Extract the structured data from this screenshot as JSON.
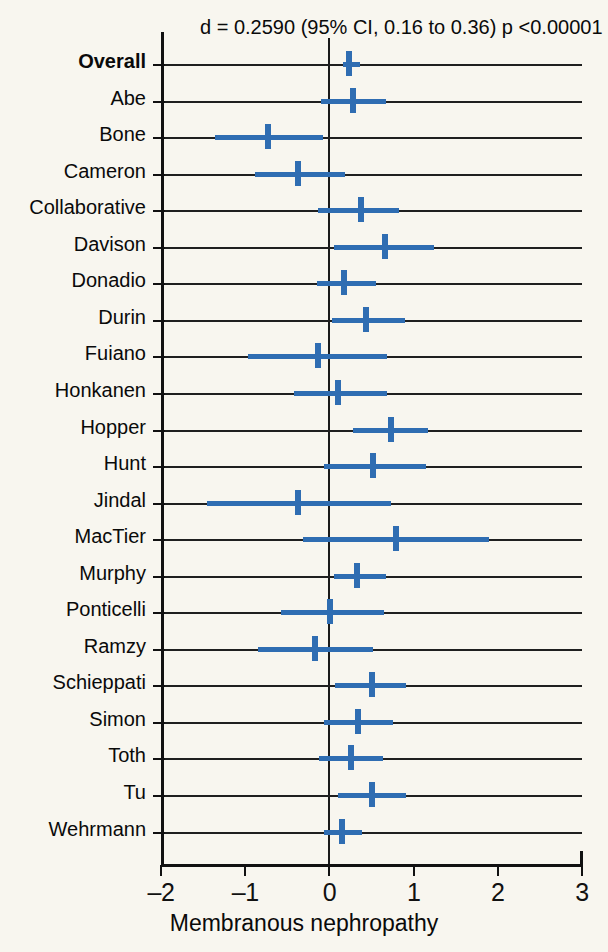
{
  "chart_data": {
    "type": "forest",
    "title": "",
    "header_annotation": "d = 0.2590 (95% CI, 0.16 to 0.36) p <0.00001",
    "xlabel": "Membranous nephropathy",
    "ylabel": "",
    "xlim": [
      -2,
      3
    ],
    "xticks": [
      -2,
      -1,
      0,
      1,
      2,
      3
    ],
    "xtick_labels": [
      "–2",
      "–1",
      "0",
      "1",
      "2",
      "3"
    ],
    "reference_line": 0,
    "grid": "horizontal-row-lines",
    "legend": "none",
    "effect_measure": "d",
    "overall": {
      "label": "Overall",
      "d": 0.259,
      "ci_low": 0.16,
      "ci_high": 0.36,
      "p": "<0.00001"
    },
    "categories": [
      "Overall",
      "Abe",
      "Bone",
      "Cameron",
      "Collaborative",
      "Davison",
      "Donadio",
      "Durin",
      "Fuiano",
      "Honkanen",
      "Hopper",
      "Hunt",
      "Jindal",
      "MacTier",
      "Murphy",
      "Ponticelli",
      "Ramzy",
      "Schieppati",
      "Simon",
      "Toth",
      "Tu",
      "Wehrmann"
    ],
    "studies": [
      {
        "label": "Overall",
        "bold": true,
        "d": 0.23,
        "ci_low": 0.16,
        "ci_high": 0.36
      },
      {
        "label": "Abe",
        "bold": false,
        "d": 0.28,
        "ci_low": -0.1,
        "ci_high": 0.67
      },
      {
        "label": "Bone",
        "bold": false,
        "d": -0.73,
        "ci_low": -1.36,
        "ci_high": -0.08
      },
      {
        "label": "Cameron",
        "bold": false,
        "d": -0.37,
        "ci_low": -0.88,
        "ci_high": 0.18
      },
      {
        "label": "Collaborative",
        "bold": false,
        "d": 0.37,
        "ci_low": -0.13,
        "ci_high": 0.83
      },
      {
        "label": "Davison",
        "bold": false,
        "d": 0.66,
        "ci_low": 0.06,
        "ci_high": 1.24
      },
      {
        "label": "Donadio",
        "bold": false,
        "d": 0.17,
        "ci_low": -0.15,
        "ci_high": 0.55
      },
      {
        "label": "Durin",
        "bold": false,
        "d": 0.43,
        "ci_low": 0.03,
        "ci_high": 0.9
      },
      {
        "label": "Fuiano",
        "bold": false,
        "d": -0.13,
        "ci_low": -0.97,
        "ci_high": 0.69
      },
      {
        "label": "Honkanen",
        "bold": false,
        "d": 0.1,
        "ci_low": -0.42,
        "ci_high": 0.69
      },
      {
        "label": "Hopper",
        "bold": false,
        "d": 0.73,
        "ci_low": 0.28,
        "ci_high": 1.17
      },
      {
        "label": "Hunt",
        "bold": false,
        "d": 0.52,
        "ci_low": -0.07,
        "ci_high": 1.15
      },
      {
        "label": "Jindal",
        "bold": false,
        "d": -0.37,
        "ci_low": -1.45,
        "ci_high": 0.73
      },
      {
        "label": "MacTier",
        "bold": false,
        "d": 0.79,
        "ci_low": -0.31,
        "ci_high": 1.89
      },
      {
        "label": "Murphy",
        "bold": false,
        "d": 0.33,
        "ci_low": 0.05,
        "ci_high": 0.67
      },
      {
        "label": "Ponticelli",
        "bold": false,
        "d": 0.01,
        "ci_low": -0.57,
        "ci_high": 0.65
      },
      {
        "label": "Ramzy",
        "bold": false,
        "d": -0.17,
        "ci_low": -0.85,
        "ci_high": 0.52
      },
      {
        "label": "Schieppati",
        "bold": false,
        "d": 0.5,
        "ci_low": 0.07,
        "ci_high": 0.91
      },
      {
        "label": "Simon",
        "bold": false,
        "d": 0.34,
        "ci_low": -0.07,
        "ci_high": 0.75
      },
      {
        "label": "Toth",
        "bold": false,
        "d": 0.26,
        "ci_low": -0.12,
        "ci_high": 0.64
      },
      {
        "label": "Tu",
        "bold": false,
        "d": 0.51,
        "ci_low": 0.1,
        "ci_high": 0.91
      },
      {
        "label": "Wehrmann",
        "bold": false,
        "d": 0.15,
        "ci_low": -0.06,
        "ci_high": 0.39
      }
    ],
    "colors": {
      "marker": "#2F6DB2",
      "ci": "#2F6DB2",
      "axis": "#111111",
      "row_line": "#1f1f1f",
      "background": "#F8F6EF"
    }
  }
}
